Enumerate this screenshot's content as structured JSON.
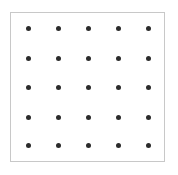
{
  "diagram": {
    "type": "dot-grid",
    "rows": 5,
    "cols": 5,
    "dot_color": "#2b2b2b",
    "border_color": "#c8c8c8",
    "col_positions": [
      28,
      58,
      88,
      118,
      148
    ],
    "row_positions": [
      28,
      58,
      87,
      117,
      145
    ]
  }
}
